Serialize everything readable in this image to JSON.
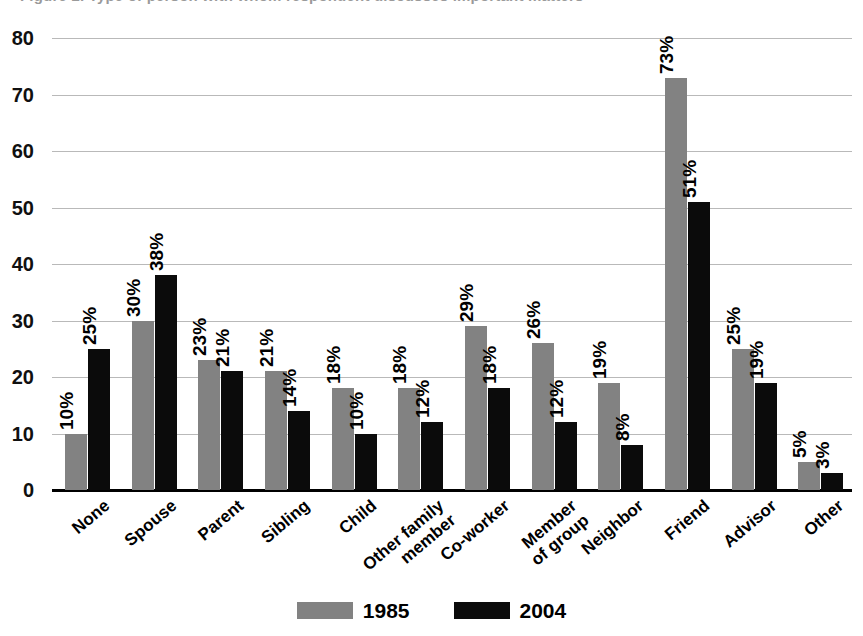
{
  "title_fragment": "Figure 2. Type of person with whom respondent discusses important matters",
  "legend": {
    "position": "bottom-center",
    "entries": [
      {
        "label": "1985",
        "color": "#828282",
        "swatch": "legend-swatch-1985"
      },
      {
        "label": "2004",
        "color": "#0b0b0b",
        "swatch": "legend-swatch-2004"
      }
    ]
  },
  "yaxis": {
    "ticks": [
      "0",
      "10",
      "20",
      "30",
      "40",
      "50",
      "60",
      "70",
      "80"
    ]
  },
  "chart_data": {
    "type": "bar",
    "title": "",
    "xlabel": "",
    "ylabel": "",
    "ylim": [
      0,
      80
    ],
    "ytick_step": 10,
    "grid": true,
    "legend_position": "bottom-center",
    "orientation": "vertical-grouped",
    "value_label_suffix": "%",
    "value_label_rotation": -90,
    "categories": [
      "None",
      "Spouse",
      "Parent",
      "Sibling",
      "Child",
      "Other family member",
      "Co-worker",
      "Member of group",
      "Neighbor",
      "Friend",
      "Advisor",
      "Other"
    ],
    "category_lines": [
      [
        "None"
      ],
      [
        "Spouse"
      ],
      [
        "Parent"
      ],
      [
        "Sibling"
      ],
      [
        "Child"
      ],
      [
        "Other family",
        "member"
      ],
      [
        "Co-worker"
      ],
      [
        "Member",
        "of group"
      ],
      [
        "Neighbor"
      ],
      [
        "Friend"
      ],
      [
        "Advisor"
      ],
      [
        "Other"
      ]
    ],
    "series": [
      {
        "name": "1985",
        "color": "#828282",
        "values": [
          10,
          30,
          23,
          21,
          18,
          18,
          29,
          26,
          19,
          73,
          25,
          5
        ],
        "labels": [
          "10%",
          "30%",
          "23%",
          "21%",
          "18%",
          "18%",
          "29%",
          "26%",
          "19%",
          "73%",
          "25%",
          "5%"
        ]
      },
      {
        "name": "2004",
        "color": "#0b0b0b",
        "values": [
          25,
          38,
          21,
          14,
          10,
          12,
          18,
          12,
          8,
          51,
          19,
          3
        ],
        "labels": [
          "25%",
          "38%",
          "21%",
          "14%",
          "10%",
          "12%",
          "18%",
          "12%",
          "8%",
          "51%",
          "19%",
          "3%"
        ]
      }
    ]
  }
}
